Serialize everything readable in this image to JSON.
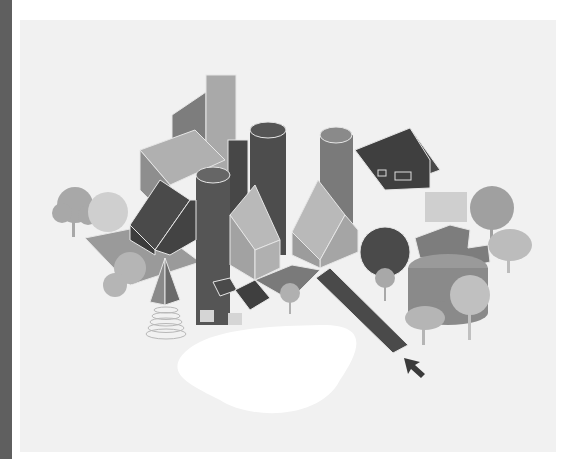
{
  "illustration": {
    "subject": "isometric cluster of buildings",
    "palette": {
      "background": "#ffffff",
      "panel": "#f1f1f1",
      "side_strip": "#5f5f5f",
      "dark": "#4a4a4a",
      "mid": "#7d7d7d",
      "light": "#a8a8a8",
      "pale": "#c8c8c8",
      "pond": "#ffffff",
      "tree": "#b5b5b5",
      "outline": "#e6e6e6"
    },
    "elements": [
      "tall-box",
      "cylinder-silo-left",
      "cylinder-silo-center",
      "cylinder-silo-right",
      "dark-house-left",
      "dark-house-right",
      "gable-house-center-left",
      "gable-house-center-right",
      "long-dark-ramp",
      "sphere",
      "round-tank",
      "cross-shaped-roof",
      "pyramid",
      "spiral-cone",
      "trees",
      "pond",
      "cursor-arrow"
    ]
  }
}
